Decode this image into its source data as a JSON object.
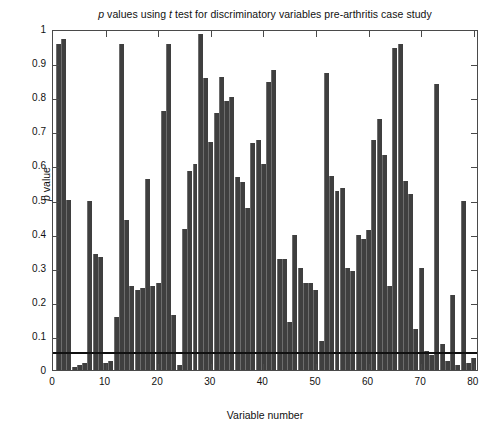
{
  "chart_data": {
    "type": "bar",
    "title": "p values using t test for discriminatory variables pre-arthritis case study",
    "title_parts": {
      "p_italic": "p",
      "mid1": " values using ",
      "t_italic": "t",
      "mid2": " test for discriminatory variables pre-arthritis case study"
    },
    "xlabel": "Variable number",
    "ylabel": "p value",
    "ylabel_parts": {
      "p_italic": "p",
      "rest": " value"
    },
    "xlim": [
      0,
      81
    ],
    "ylim": [
      0,
      1
    ],
    "grid": false,
    "legend": null,
    "bar_color": "#3f3f3f",
    "annotations": [
      {
        "name": "significance-threshold",
        "type": "hline",
        "y": 0.05,
        "color": "#111111"
      }
    ],
    "ytick_labels": [
      "0",
      "0.1",
      "0.2",
      "0.3",
      "0.4",
      "0.5",
      "0.6",
      "0.7",
      "0.8",
      "0.9",
      "1"
    ],
    "ytick_values": [
      0,
      0.1,
      0.2,
      0.3,
      0.4,
      0.5,
      0.6,
      0.7,
      0.8,
      0.9,
      1
    ],
    "xtick_labels": [
      "0",
      "10",
      "20",
      "30",
      "40",
      "50",
      "60",
      "70",
      "80"
    ],
    "xtick_values": [
      0,
      10,
      20,
      30,
      40,
      50,
      60,
      70,
      80
    ],
    "categories": [
      1,
      2,
      3,
      4,
      5,
      6,
      7,
      8,
      9,
      10,
      11,
      12,
      13,
      14,
      15,
      16,
      17,
      18,
      19,
      20,
      21,
      22,
      23,
      24,
      25,
      26,
      27,
      28,
      29,
      30,
      31,
      32,
      33,
      34,
      35,
      36,
      37,
      38,
      39,
      40,
      41,
      42,
      43,
      44,
      45,
      46,
      47,
      48,
      49,
      50,
      51,
      52,
      53,
      54,
      55,
      56,
      57,
      58,
      59,
      60,
      61,
      62,
      63,
      64,
      65,
      66,
      67,
      68,
      69,
      70,
      71,
      72,
      73,
      74,
      75,
      76,
      77,
      78,
      79,
      80
    ],
    "values": [
      0.955,
      0.972,
      0.5,
      0.01,
      0.015,
      0.02,
      0.495,
      0.34,
      0.33,
      0.02,
      0.025,
      0.155,
      0.955,
      0.44,
      0.245,
      0.235,
      0.24,
      0.56,
      0.245,
      0.255,
      0.76,
      0.955,
      0.16,
      0.015,
      0.415,
      0.585,
      0.605,
      0.985,
      0.855,
      0.67,
      0.755,
      0.86,
      0.79,
      0.8,
      0.565,
      0.55,
      0.475,
      0.665,
      0.675,
      0.605,
      0.845,
      0.88,
      0.325,
      0.325,
      0.14,
      0.395,
      0.3,
      0.255,
      0.255,
      0.235,
      0.085,
      0.87,
      0.57,
      0.525,
      0.535,
      0.3,
      0.29,
      0.395,
      0.385,
      0.41,
      0.675,
      0.735,
      0.63,
      0.245,
      0.945,
      0.955,
      0.555,
      0.515,
      0.12,
      0.3,
      0.055,
      0.045,
      0.84,
      0.075,
      0.025,
      0.22,
      0.015,
      0.495,
      0.02,
      0.035
    ]
  }
}
